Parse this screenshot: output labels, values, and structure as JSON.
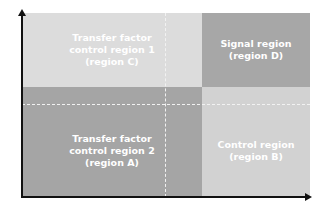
{
  "diagram": {
    "regions": {
      "C": {
        "label": "Transfer factor\ncontrol region 1\n(region C)",
        "color": "#dcdcdc"
      },
      "D": {
        "label": "Signal region\n(region D)",
        "color": "#a7a7a7"
      },
      "A": {
        "label": "Transfer factor\ncontrol region 2\n(region A)",
        "color": "#a5a5a5"
      },
      "B": {
        "label": "Control region\n(region B)",
        "color": "#d2d2d2"
      }
    },
    "axes": {
      "x_arrow": "right-arrow",
      "y_arrow": "up-arrow"
    }
  }
}
